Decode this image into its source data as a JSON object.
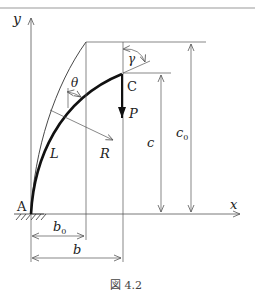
{
  "figure": {
    "caption": "図 4.2",
    "labels": {
      "y_axis": "y",
      "x_axis": "x",
      "origin": "A",
      "tip": "C",
      "theta": "θ",
      "gamma": "γ",
      "force": "P",
      "length": "L",
      "radius": "R",
      "height": "c",
      "height_initial": "c",
      "height_initial_sub": "0",
      "width": "b",
      "width_initial": "b",
      "width_initial_sub": "0"
    }
  }
}
